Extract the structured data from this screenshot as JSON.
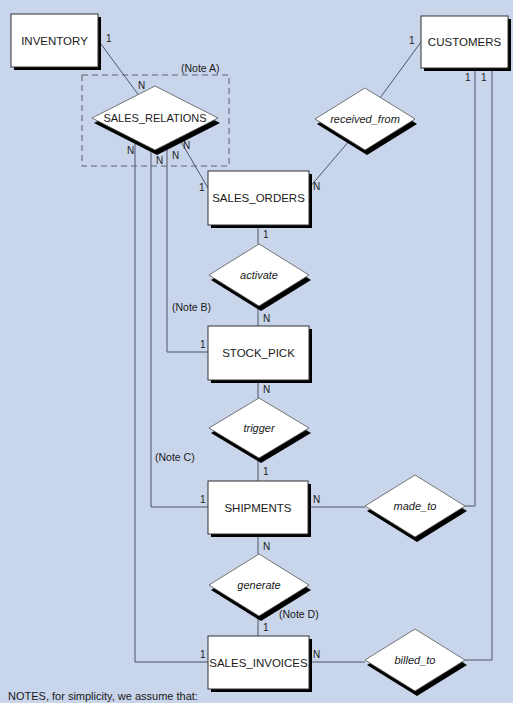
{
  "diagram": {
    "background": "#c9d5ea",
    "entities": [
      {
        "id": "inventory",
        "label": "INVENTORY",
        "x": 11,
        "y": 14,
        "w": 87,
        "h": 53
      },
      {
        "id": "customers",
        "label": "CUSTOMERS",
        "x": 421,
        "y": 16,
        "w": 87,
        "h": 52
      },
      {
        "id": "sales_orders",
        "label": "SALES_ORDERS",
        "x": 208,
        "y": 171,
        "w": 101,
        "h": 54
      },
      {
        "id": "stock_pick",
        "label": "STOCK_PICK",
        "x": 208,
        "y": 326,
        "w": 101,
        "h": 54
      },
      {
        "id": "shipments",
        "label": "SHIPMENTS",
        "x": 208,
        "y": 481,
        "w": 100,
        "h": 53
      },
      {
        "id": "sales_invoices",
        "label": "SALES_INVOICES",
        "x": 208,
        "y": 636,
        "w": 101,
        "h": 53
      }
    ],
    "relationships": [
      {
        "id": "sales_relations",
        "label": "SALES_RELATIONS",
        "cx": 155,
        "cy": 118,
        "hw": 63,
        "hh": 32,
        "italic": false
      },
      {
        "id": "received_from",
        "label": "received_from",
        "cx": 365,
        "cy": 119,
        "hw": 50,
        "hh": 31,
        "italic": true
      },
      {
        "id": "activate",
        "label": "activate",
        "cx": 259,
        "cy": 275,
        "hw": 50,
        "hh": 31,
        "italic": true
      },
      {
        "id": "trigger",
        "label": "trigger",
        "cx": 259,
        "cy": 428,
        "hw": 50,
        "hh": 30,
        "italic": true
      },
      {
        "id": "made_to",
        "label": "made_to",
        "cx": 415,
        "cy": 506,
        "hw": 50,
        "hh": 31,
        "italic": true
      },
      {
        "id": "generate",
        "label": "generate",
        "cx": 259,
        "cy": 585,
        "hw": 50,
        "hh": 31,
        "italic": true
      },
      {
        "id": "billed_to",
        "label": "billed_to",
        "cx": 415,
        "cy": 660,
        "hw": 50,
        "hh": 31,
        "italic": true
      }
    ],
    "cardinalities": [
      {
        "text": "1",
        "x": 106,
        "y": 42
      },
      {
        "text": "N",
        "x": 138,
        "y": 89
      },
      {
        "text": "N",
        "x": 127,
        "y": 154
      },
      {
        "text": "N",
        "x": 156,
        "y": 164
      },
      {
        "text": "N",
        "x": 172,
        "y": 159
      },
      {
        "text": "N",
        "x": 183,
        "y": 149
      },
      {
        "text": "1",
        "x": 199,
        "y": 191
      },
      {
        "text": "1",
        "x": 409,
        "y": 44
      },
      {
        "text": "N",
        "x": 313,
        "y": 190
      },
      {
        "text": "1",
        "x": 465,
        "y": 81
      },
      {
        "text": "1",
        "x": 481,
        "y": 81
      },
      {
        "text": "1",
        "x": 263,
        "y": 238
      },
      {
        "text": "N",
        "x": 263,
        "y": 322
      },
      {
        "text": "1",
        "x": 200,
        "y": 348
      },
      {
        "text": "N",
        "x": 263,
        "y": 393
      },
      {
        "text": "1",
        "x": 263,
        "y": 475
      },
      {
        "text": "1",
        "x": 200,
        "y": 503
      },
      {
        "text": "N",
        "x": 313,
        "y": 503
      },
      {
        "text": "N",
        "x": 263,
        "y": 550
      },
      {
        "text": "1",
        "x": 263,
        "y": 631
      },
      {
        "text": "1",
        "x": 200,
        "y": 658
      },
      {
        "text": "N",
        "x": 313,
        "y": 658
      }
    ],
    "notes": [
      {
        "text": "(Note A)",
        "x": 181,
        "y": 72
      },
      {
        "text": "(Note B)",
        "x": 172,
        "y": 311
      },
      {
        "text": "(Note C)",
        "x": 155,
        "y": 461
      },
      {
        "text": "(Note D)",
        "x": 279,
        "y": 618
      }
    ],
    "dashed_box": {
      "x": 82,
      "y": 75,
      "w": 147,
      "h": 91
    },
    "footer_text": "NOTES, for simplicity, we assume that:"
  }
}
